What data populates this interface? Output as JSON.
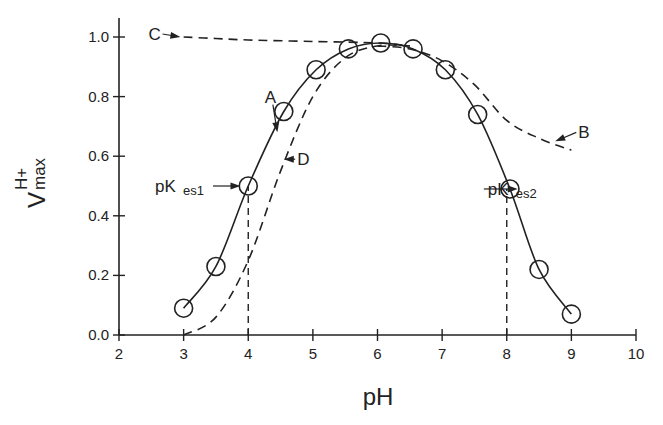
{
  "chart_data": {
    "type": "line",
    "title": "",
    "xlabel": "pH",
    "ylabel": "V",
    "ylabel_superscript": "H+",
    "ylabel_subscript": "max",
    "xlim": [
      2,
      10
    ],
    "ylim": [
      0.0,
      1.0
    ],
    "grid": false,
    "x_ticks": [
      2,
      3,
      4,
      5,
      6,
      7,
      8,
      9,
      10
    ],
    "x_tick_labels": [
      "2",
      "3",
      "4",
      "5",
      "6",
      "7",
      "8",
      "9",
      "10"
    ],
    "y_ticks": [
      0.0,
      0.2,
      0.4,
      0.6,
      0.8,
      1.0
    ],
    "y_tick_labels": [
      "0.0",
      "0.2",
      "0.4",
      "0.6",
      "0.8",
      "1.0"
    ],
    "series": [
      {
        "name": "A",
        "style": "solid",
        "markers": "open-circle",
        "x": [
          3.0,
          3.5,
          4.0,
          4.55,
          5.05,
          5.55,
          6.05,
          6.55,
          7.05,
          7.55,
          8.05,
          8.5,
          9.0
        ],
        "y": [
          0.09,
          0.23,
          0.5,
          0.75,
          0.89,
          0.96,
          0.98,
          0.96,
          0.89,
          0.74,
          0.49,
          0.22,
          0.07
        ]
      },
      {
        "name": "B",
        "style": "dashed",
        "x": [
          6.0,
          6.5,
          7.0,
          7.5,
          8.0,
          8.5,
          9.0
        ],
        "y": [
          0.97,
          0.96,
          0.92,
          0.84,
          0.72,
          0.66,
          0.62
        ]
      },
      {
        "name": "C",
        "style": "dashed",
        "x": [
          3.0,
          3.5,
          4.0,
          5.0,
          6.0,
          6.5
        ],
        "y": [
          1.0,
          0.995,
          0.99,
          0.985,
          0.98,
          0.97
        ]
      },
      {
        "name": "D",
        "style": "dashed",
        "x": [
          3.0,
          3.5,
          4.0,
          4.5,
          5.0,
          5.5,
          6.0,
          6.5
        ],
        "y": [
          0.0,
          0.06,
          0.25,
          0.55,
          0.8,
          0.93,
          0.97,
          0.97
        ]
      }
    ],
    "annotations": [
      {
        "text": "A",
        "x": 4.35,
        "y": 0.8,
        "arrow_to": [
          4.45,
          0.68
        ]
      },
      {
        "text": "B",
        "x": 9.2,
        "y": 0.68,
        "arrow_to": [
          8.75,
          0.65
        ]
      },
      {
        "text": "C",
        "x": 2.55,
        "y": 1.01,
        "arrow_to": [
          2.95,
          1.0
        ]
      },
      {
        "text": "D",
        "x": 4.85,
        "y": 0.59,
        "arrow_to": [
          4.55,
          0.59
        ]
      },
      {
        "text": "pK",
        "sub": "es1",
        "x": 3.3,
        "y": 0.5,
        "arrow_to": [
          3.88,
          0.5
        ]
      },
      {
        "text": "pK",
        "sub": "es2",
        "x": 8.45,
        "y": 0.49,
        "arrow_to": [
          8.17,
          0.49
        ]
      }
    ],
    "reference_lines": [
      {
        "type": "vertical",
        "style": "dashed",
        "x": 4.0,
        "y_from": 0.0,
        "y_to": 0.5
      },
      {
        "type": "vertical",
        "style": "dashed",
        "x": 8.0,
        "y_from": 0.0,
        "y_to": 0.49
      }
    ]
  }
}
